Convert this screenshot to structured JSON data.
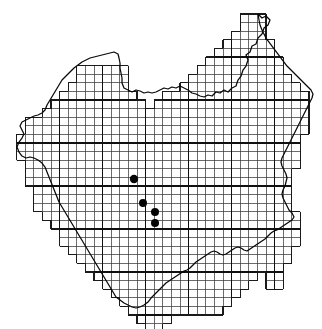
{
  "figure": {
    "kind": "species-distribution-map",
    "region_name": "Missouri",
    "caption": "",
    "background_color": "#ffffff"
  },
  "chart_data": {
    "type": "scatter",
    "title": "",
    "subtitle": "",
    "xlabel": "",
    "ylabel": "",
    "grid": {
      "visible": true,
      "cell_size_px": 8.6,
      "origin_x_px": 16.6,
      "origin_y_px": 14.0,
      "minor_line_color": "#3a3a3a",
      "major_line_color": "#101010",
      "major_every_n_cells": 5,
      "columns": 35,
      "rows": 37
    },
    "outline": {
      "color": "#080808",
      "stroke_width": 1.25,
      "closed": true
    },
    "points": [
      {
        "id": "record-1",
        "x": 134,
        "y": 179,
        "r": 4.2,
        "color": "#050505"
      },
      {
        "id": "record-2",
        "x": 143,
        "y": 203,
        "r": 4.0,
        "color": "#050505"
      },
      {
        "id": "record-3",
        "x": 155,
        "y": 212,
        "r": 4.0,
        "color": "#050505"
      },
      {
        "id": "record-4",
        "x": 155,
        "y": 223,
        "r": 4.0,
        "color": "#050505"
      }
    ],
    "point_count": 4,
    "xlim": [
      0,
      322
    ],
    "ylim": [
      0,
      329
    ],
    "legend": {
      "visible": false,
      "entries": []
    },
    "axes": {
      "visible": false,
      "ticks": []
    }
  },
  "accessibility": {
    "figure_label": "Distribution map",
    "grid_label": "Occurrence grid overlay",
    "outline_label": "State boundary outline",
    "dots_label": "Occurrence records"
  }
}
